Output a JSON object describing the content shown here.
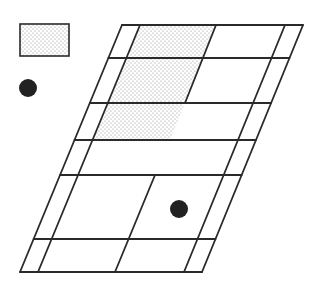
{
  "diagram": {
    "width": 323,
    "height": 297,
    "colors": {
      "background": "#ffffff",
      "stroke": "#2a2a2a",
      "dot_fill": "#222222",
      "stipple": "#8a8a8a"
    },
    "legend": {
      "shaded_swatch": {
        "x": 20,
        "y": 24,
        "w": 49,
        "h": 32,
        "pattern": "stipple"
      },
      "dot_marker": {
        "cx": 28,
        "cy": 88,
        "r": 9
      }
    },
    "court": {
      "shape": "parallelogram-grid",
      "top_y": 25,
      "bottom_y": 272,
      "outer_left": {
        "top_x": 122,
        "bottom_x": 20
      },
      "inner_left": {
        "top_x": 140,
        "bottom_x": 38
      },
      "inner_right": {
        "top_x": 285,
        "bottom_x": 184
      },
      "outer_right": {
        "top_x": 303,
        "bottom_x": 202
      },
      "row_lines_y": [
        25,
        58,
        103,
        140,
        175,
        239,
        272
      ],
      "upper_center_line": {
        "x1": 216,
        "y1": 25,
        "x2": 185,
        "y2": 103
      },
      "lower_center_line": {
        "x1": 155,
        "y1": 175,
        "x2": 115,
        "y2": 272
      },
      "shaded_regions": [
        {
          "points": "140,25 216,25 185,103 108,103"
        },
        {
          "points": "108,103 185,103 170,140 93,140"
        }
      ],
      "dot_marker": {
        "cx": 179,
        "cy": 209,
        "r": 9
      }
    }
  }
}
